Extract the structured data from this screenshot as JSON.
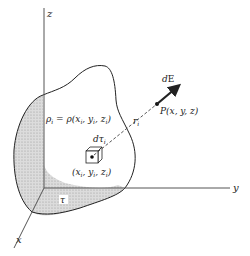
{
  "diagram": {
    "type": "electrostatics-charge-distribution",
    "axes": {
      "x_label": "x",
      "y_label": "y",
      "z_label": "z"
    },
    "labels": {
      "density": "ρ_i = ρ(x_i, y_i, z_i)",
      "density_lhs": "ρ",
      "density_rhs": "= ρ(x",
      "volume_element": "dτ",
      "source_point": "(x_i, y_i, z_i)",
      "separation": "r",
      "field_point": "P(x, y, z)",
      "field_vector": "dE",
      "region": "τ"
    },
    "colors": {
      "line": "#222222",
      "shade": "#c8c8c8",
      "background": "#ffffff"
    }
  }
}
